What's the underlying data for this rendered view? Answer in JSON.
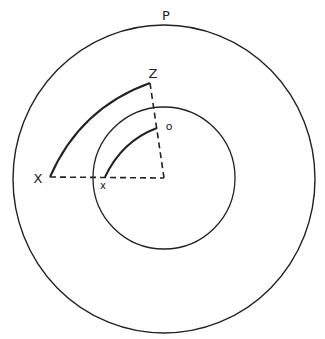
{
  "diagram": {
    "colors": {
      "background": "#ffffff",
      "stroke": "#222222"
    },
    "center": {
      "x": 164,
      "y": 178
    },
    "outer_circle": {
      "label": "P",
      "cx": 164,
      "cy": 179,
      "r": 153
    },
    "inner_circle": {
      "cx": 164,
      "cy": 178,
      "r": 71
    },
    "outer_arc": {
      "start_label": "X",
      "end_label": "Z"
    },
    "inner_arc": {
      "start_label": "x",
      "end_label": "o"
    },
    "labels": {
      "P": "P",
      "Z": "Z",
      "o": "o",
      "X": "X",
      "x": "x"
    }
  }
}
